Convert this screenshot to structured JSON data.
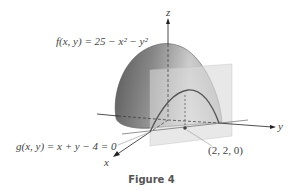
{
  "figure": {
    "caption": "Figure 4",
    "labels": {
      "f_eq": "f(x, y) = 25 − x² − y²",
      "g_eq": "g(x, y) = x + y − 4 = 0",
      "point": "(2, 2, 0)",
      "axis_x": "x",
      "axis_y": "y",
      "axis_z": "z"
    },
    "colors": {
      "surface_dark": "#5a5a5a",
      "surface_light": "#e6e6e6",
      "plane": "#d8d8d8",
      "axes": "#222222",
      "curve": "#555555"
    }
  }
}
